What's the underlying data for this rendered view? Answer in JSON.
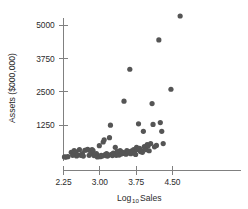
{
  "chart_data": {
    "type": "scatter",
    "title": "",
    "xlabel": "Log10 Sales",
    "xlabel_base": "Log",
    "xlabel_sub": "10",
    "xlabel_rest": " Sales",
    "ylabel": "Assets ($000,000)",
    "xticks": [
      2.25,
      3.0,
      3.75,
      4.5
    ],
    "xtick_labels": [
      "2.25",
      "3.00",
      "3.75",
      "4.50"
    ],
    "yticks": [
      1250,
      2500,
      3750,
      5000
    ],
    "ytick_labels": [
      "1250",
      "2500",
      "3750",
      "5000"
    ],
    "xlim": [
      2.12,
      4.78
    ],
    "ylim": [
      0,
      5400
    ],
    "grid": false,
    "legend": null,
    "marker_color": "#555555",
    "axis_color": "#808080",
    "text_color": "#2b2b2b",
    "marker_radius": 2.6,
    "points": [
      [
        2.27,
        60
      ],
      [
        2.3,
        55
      ],
      [
        2.34,
        70
      ],
      [
        2.41,
        230
      ],
      [
        2.44,
        120
      ],
      [
        2.47,
        300
      ],
      [
        2.5,
        250
      ],
      [
        2.52,
        95
      ],
      [
        2.55,
        140
      ],
      [
        2.58,
        330
      ],
      [
        2.61,
        120
      ],
      [
        2.64,
        180
      ],
      [
        2.66,
        90
      ],
      [
        2.69,
        310
      ],
      [
        2.72,
        320
      ],
      [
        2.75,
        340
      ],
      [
        2.78,
        120
      ],
      [
        2.81,
        190
      ],
      [
        2.84,
        330
      ],
      [
        2.86,
        300
      ],
      [
        2.88,
        110
      ],
      [
        2.91,
        150
      ],
      [
        2.93,
        180
      ],
      [
        2.95,
        60
      ],
      [
        2.97,
        100
      ],
      [
        2.99,
        480
      ],
      [
        3.01,
        70
      ],
      [
        3.03,
        120
      ],
      [
        3.05,
        90
      ],
      [
        3.07,
        620
      ],
      [
        3.09,
        700
      ],
      [
        3.11,
        150
      ],
      [
        3.12,
        110
      ],
      [
        3.14,
        180
      ],
      [
        3.16,
        90
      ],
      [
        3.18,
        130
      ],
      [
        3.2,
        780
      ],
      [
        3.22,
        1250
      ],
      [
        3.24,
        160
      ],
      [
        3.26,
        110
      ],
      [
        3.28,
        200
      ],
      [
        3.3,
        150
      ],
      [
        3.32,
        420
      ],
      [
        3.34,
        120
      ],
      [
        3.36,
        260
      ],
      [
        3.38,
        180
      ],
      [
        3.4,
        130
      ],
      [
        3.42,
        300
      ],
      [
        3.44,
        170
      ],
      [
        3.46,
        240
      ],
      [
        3.48,
        190
      ],
      [
        3.5,
        2150
      ],
      [
        3.52,
        220
      ],
      [
        3.54,
        160
      ],
      [
        3.56,
        300
      ],
      [
        3.58,
        210
      ],
      [
        3.6,
        260
      ],
      [
        3.62,
        3350
      ],
      [
        3.64,
        180
      ],
      [
        3.66,
        290
      ],
      [
        3.68,
        230
      ],
      [
        3.7,
        330
      ],
      [
        3.72,
        200
      ],
      [
        3.74,
        150
      ],
      [
        3.76,
        420
      ],
      [
        3.78,
        340
      ],
      [
        3.8,
        1300
      ],
      [
        3.82,
        380
      ],
      [
        3.84,
        260
      ],
      [
        3.86,
        300
      ],
      [
        3.88,
        230
      ],
      [
        3.9,
        1020
      ],
      [
        3.92,
        450
      ],
      [
        3.94,
        390
      ],
      [
        3.96,
        330
      ],
      [
        3.98,
        520
      ],
      [
        4.0,
        480
      ],
      [
        4.02,
        290
      ],
      [
        4.05,
        560
      ],
      [
        4.08,
        2060
      ],
      [
        4.1,
        1280
      ],
      [
        4.13,
        440
      ],
      [
        4.17,
        490
      ],
      [
        4.22,
        4450
      ],
      [
        4.25,
        1350
      ],
      [
        4.28,
        1020
      ],
      [
        4.31,
        560
      ],
      [
        4.47,
        2600
      ],
      [
        4.66,
        5350
      ]
    ]
  }
}
